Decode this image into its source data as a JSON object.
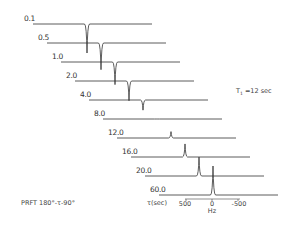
{
  "chart_data": {
    "type": "line",
    "subtitle": "stacked NMR spectra (inversion recovery)",
    "annotation_t1": "T",
    "annotation_t1_sub": "1",
    "annotation_t1_value": " =12 sec",
    "sequence_label": "PRFT  180°-τ-90°",
    "xlabel_tau": "τ(sec)",
    "xlabel_freq": "Hz",
    "x_ticks": [
      "500",
      "0",
      "-500"
    ],
    "xlim_hz": [
      800,
      -800
    ],
    "tau_labels": [
      "0.1",
      "0.5",
      "1.0",
      "2.0",
      "4.0",
      "8.0",
      "12.0",
      "16.0",
      "20.0",
      "60.0"
    ],
    "series": [
      {
        "tau": "0.1",
        "peak_intensity": -1.0
      },
      {
        "tau": "0.5",
        "peak_intensity": -0.92
      },
      {
        "tau": "1.0",
        "peak_intensity": -0.78
      },
      {
        "tau": "2.0",
        "peak_intensity": -0.68
      },
      {
        "tau": "4.0",
        "peak_intensity": -0.35
      },
      {
        "tau": "8.0",
        "peak_intensity": 0.0
      },
      {
        "tau": "12.0",
        "peak_intensity": 0.22
      },
      {
        "tau": "16.0",
        "peak_intensity": 0.45
      },
      {
        "tau": "20.0",
        "peak_intensity": 0.65
      },
      {
        "tau": "60.0",
        "peak_intensity": 1.0
      }
    ]
  }
}
